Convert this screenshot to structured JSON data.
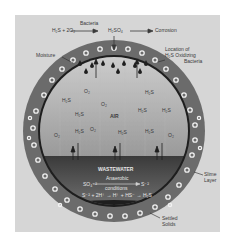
{
  "diagram": {
    "title_reaction": {
      "reactants": "H₂S + 2O₂",
      "catalyst": "Bacteria",
      "product": "H₂SO₄",
      "result": "Corrosion"
    },
    "labels": {
      "moisture": "Moisture",
      "location": "Location of",
      "location2": "H₂S Oxidizing",
      "location3": "Bacteria",
      "air": "AIR",
      "wastewater": "WASTEWATER",
      "reaction_left": "SO₄⁻²",
      "reaction_cond1": "Anaerobic",
      "reaction_cond2": "conditions",
      "reaction_right": "S⁻²",
      "equation": "S⁻² + 2H⁺ → H⁺ + HS⁻ → H₂S",
      "slime1": "Slime",
      "slime2": "Layer",
      "settled1": "Settled",
      "settled2": "Solids"
    },
    "gases": [
      {
        "text": "O₂",
        "x": 84,
        "y": 90
      },
      {
        "text": "H₂S",
        "x": 145,
        "y": 91
      },
      {
        "text": "H₂S",
        "x": 62,
        "y": 99
      },
      {
        "text": "O₂",
        "x": 101,
        "y": 103
      },
      {
        "text": "H₂S",
        "x": 75,
        "y": 113
      },
      {
        "text": "H₂S",
        "x": 138,
        "y": 109
      },
      {
        "text": "H₂S",
        "x": 162,
        "y": 109
      },
      {
        "text": "O₂",
        "x": 90,
        "y": 128
      },
      {
        "text": "H₂S",
        "x": 75,
        "y": 130
      },
      {
        "text": "H₂S",
        "x": 118,
        "y": 131
      },
      {
        "text": "H₂S",
        "x": 145,
        "y": 130
      },
      {
        "text": "O₂",
        "x": 54,
        "y": 134
      },
      {
        "text": "O₂",
        "x": 168,
        "y": 134
      }
    ],
    "colors": {
      "panel": "#d6d6d6",
      "pipe_wall": "#6b6b6b",
      "air": "#a8a8a8",
      "water": "#4a4a4a",
      "slime": "#1e1e1e"
    }
  }
}
